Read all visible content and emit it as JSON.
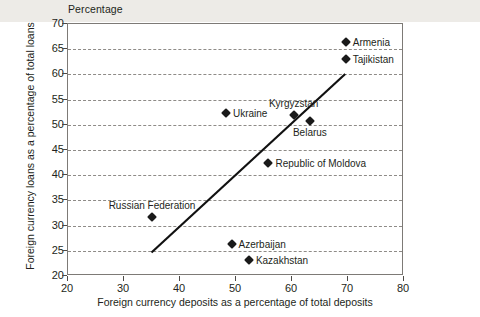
{
  "chart_data": {
    "type": "scatter",
    "title": "Percentage",
    "xlabel": "Foreign currency deposits as a percentage of total deposits",
    "ylabel": "Foreign currency loans as a percentage of total loans",
    "xlim": [
      20,
      80
    ],
    "ylim": [
      20,
      70
    ],
    "xticks": [
      20,
      30,
      40,
      50,
      60,
      70,
      80
    ],
    "yticks": [
      20,
      25,
      30,
      35,
      40,
      45,
      50,
      55,
      60,
      65,
      70
    ],
    "grid": "horizontal-dashed",
    "legend": "none",
    "marker": "diamond",
    "marker_color": "#1a1a1a",
    "points": [
      {
        "label": "Armenia",
        "x": 69.6,
        "y": 66.4,
        "label_pos": "right"
      },
      {
        "label": "Tajikistan",
        "x": 69.6,
        "y": 63.0,
        "label_pos": "right"
      },
      {
        "label": "Ukraine",
        "x": 48.2,
        "y": 52.4,
        "label_pos": "right"
      },
      {
        "label": "Kyrgyzstan",
        "x": 60.3,
        "y": 52.0,
        "label_pos": "above"
      },
      {
        "label": "Belarus",
        "x": 63.2,
        "y": 50.8,
        "label_pos": "below"
      },
      {
        "label": "Republic of Moldova",
        "x": 55.8,
        "y": 42.5,
        "label_pos": "right"
      },
      {
        "label": "Russian Federation",
        "x": 35.0,
        "y": 31.8,
        "label_pos": "above"
      },
      {
        "label": "Azerbaijan",
        "x": 49.2,
        "y": 26.3,
        "label_pos": "right"
      },
      {
        "label": "Kazakhstan",
        "x": 52.3,
        "y": 23.2,
        "label_pos": "right"
      }
    ],
    "trendline": {
      "name": "linear-fit",
      "x0": 35.0,
      "y0": 24.3,
      "x1": 69.8,
      "y1": 60.0,
      "color": "#111111"
    }
  }
}
